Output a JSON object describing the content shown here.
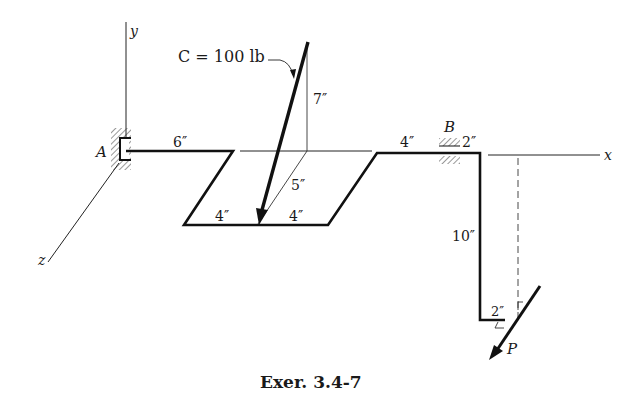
{
  "figure": {
    "caption": "Exer. 3.4-7",
    "axes": {
      "x": "x",
      "y": "y",
      "z": "z"
    },
    "supports": {
      "A": "A",
      "B": "B"
    },
    "force_C": {
      "label": "C = 100 lb"
    },
    "force_P": {
      "label": "P"
    },
    "dimensions": {
      "d_6": "6″",
      "d_7": "7″",
      "d_5": "5″",
      "d_4_left": "4″",
      "d_4_right": "4″",
      "d_4_top": "4″",
      "d_2_top": "2″",
      "d_10": "10″",
      "d_2_bottom": "2″"
    },
    "colors": {
      "ink": "#1a1a1a",
      "background": "#ffffff"
    }
  }
}
